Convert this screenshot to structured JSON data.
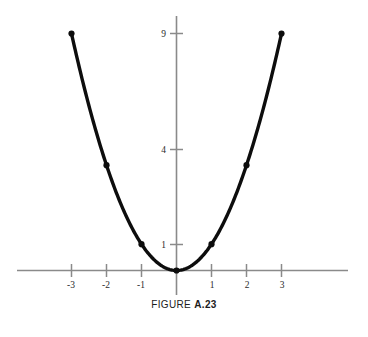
{
  "figure": {
    "caption_prefix": "FIGURE ",
    "caption_number": "A.23",
    "background_color": "#ffffff",
    "axis_color": "#8a8a8a",
    "curve_color": "#0d0d0d",
    "label_color": "#2b2b2b"
  },
  "chart_data": {
    "type": "line",
    "title": "FIGURE A.23",
    "subtitle": "",
    "xlabel": "",
    "ylabel": "",
    "function": "y = x^2",
    "grid": false,
    "legend": false,
    "legend_position": "none",
    "xlim": [
      -3.6,
      3.9
    ],
    "ylim": [
      -0.95,
      10.0
    ],
    "x_tick_labels": [
      "-3",
      "-2",
      "-1",
      "1",
      "2",
      "3"
    ],
    "x_tick_values": [
      -3,
      -2,
      -1,
      1,
      2,
      3
    ],
    "y_tick_labels": [
      "1",
      "4",
      "9"
    ],
    "y_tick_values": [
      1,
      4,
      9
    ],
    "series": [
      {
        "name": "y = x^2",
        "x": [
          -3,
          -2,
          -1,
          0,
          1,
          2,
          3
        ],
        "values": [
          9,
          4,
          1,
          0,
          1,
          4,
          9
        ],
        "marked_points": [
          {
            "x": -3,
            "y": 9
          },
          {
            "x": -2,
            "y": 4
          },
          {
            "x": -1,
            "y": 1
          },
          {
            "x": 0,
            "y": 0
          },
          {
            "x": 1,
            "y": 1
          },
          {
            "x": 2,
            "y": 4
          },
          {
            "x": 3,
            "y": 9
          }
        ]
      }
    ],
    "annotations": []
  }
}
